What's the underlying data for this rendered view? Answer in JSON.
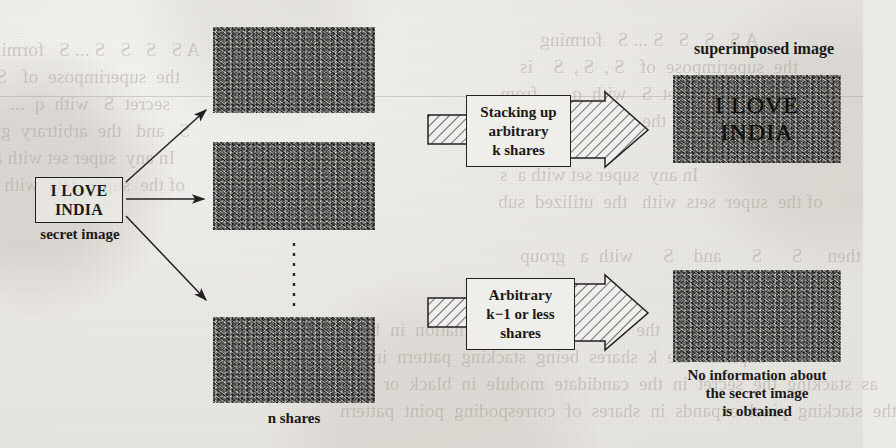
{
  "figure": {
    "secret": {
      "box_line1": "I LOVE",
      "box_line2": "INDIA",
      "caption": "secret image"
    },
    "shares": {
      "caption": "n shares",
      "count_label": "n",
      "items": [
        {
          "name": "share-1"
        },
        {
          "name": "share-2"
        },
        {
          "name": "share-3"
        }
      ],
      "ellipsis": "vertical-dotted-ellipsis"
    },
    "process_top": {
      "label_line1": "Stacking up",
      "label_line2": "arbitrary",
      "label_line3": "k shares"
    },
    "process_bottom": {
      "label_line1": "Arbitrary",
      "label_line2": "k−1 or less",
      "label_line3": "shares"
    },
    "result_top": {
      "caption": "superimposed image",
      "image_line1": "I LOVE",
      "image_line2": "INDIA"
    },
    "result_bottom": {
      "caption_line1": "No information about",
      "caption_line2": "the secret image",
      "caption_line3": "is obtained"
    }
  },
  "background_text": {
    "note": "faint bleed-through text from the reverse page of the scan",
    "lines_top_right": [
      "A S   S   S   S ... S   forming",
      "the  superimpose  of   S ,  S ,  S    is",
      "secret  S   with  q  ...  from",
      "S   and   the  arbitrary  group",
      "In any  super set with a  s",
      "of the  super  sets  with   the  utilized  sub",
      "then     S      S      and    S      with  a   group"
    ],
    "lines_bottom_left": [
      "the  correct  secret  information  in  black  and",
      "explains  the  k  shares  being  stacking  pattern  in  black",
      "as  stacking  the  secret  in  the  candidate  module  in  black  or  white",
      "the  stacking  pixel  expands  in  shares  of  correspoding  point  pattern"
    ],
    "color": "#9a968d"
  },
  "colors": {
    "paper": "#eceae6",
    "ink": "#1d1b19",
    "noise_dark": "#1c1a19",
    "noise_light": "#d9d7d2",
    "ghost": "#9a968d"
  }
}
